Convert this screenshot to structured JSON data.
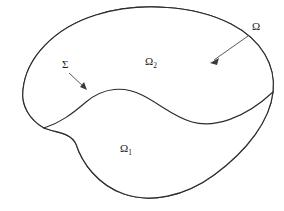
{
  "figure": {
    "name": "domain-decomposition-diagram",
    "background_color": "#ffffff",
    "outline_color": "#2b2b2b",
    "fill_color": "#ffffff",
    "stipple_color": "#8c8c8c",
    "label_color": "#1c1c1c",
    "leader_color": "#3a3a3a"
  },
  "labels": {
    "outer_domain": {
      "text": "Ω",
      "subscript": "",
      "x": 252,
      "y": 30
    },
    "upper_subregion": {
      "text": "Ω",
      "subscript": "2",
      "x": 145,
      "y": 65
    },
    "lower_subregion": {
      "text": "Ω",
      "subscript": "1",
      "x": 120,
      "y": 152
    },
    "interface": {
      "text": "Σ",
      "subscript": "",
      "x": 62,
      "y": 68
    }
  },
  "geometry": {
    "outer_boundary_path": "M 44,128 C 30,120 21,106 23,90 C 26,58 54,28 96,15 C 140,1 196,6 231,24 C 262,40 276,66 273,92 C 270,120 248,150 214,175 C 184,197 150,203 124,194 C 98,185 82,163 76,144 C 70,132 56,133 44,128 Z",
    "interface_path": "M 44,128 C 60,123 72,114 86,102 C 104,87 124,86 142,95 C 160,104 174,117 192,122 C 214,128 244,119 273,92",
    "lower_region_path": "M 44,128 C 60,123 72,114 86,102 C 104,87 124,86 142,95 C 160,104 174,117 192,122 C 214,128 244,119 273,92 C 270,120 248,150 214,175 C 184,197 150,203 124,194 C 98,185 82,163 76,144 C 70,132 56,133 44,128 Z",
    "outer_leader": {
      "x1": 248,
      "y1": 36,
      "x2": 211,
      "y2": 63
    },
    "interface_leader": {
      "x1": 69,
      "y1": 73,
      "x2": 86,
      "y2": 90
    }
  }
}
